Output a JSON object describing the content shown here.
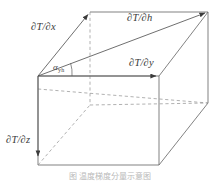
{
  "figure": {
    "labels": {
      "dtdx": "∂T/∂x",
      "dtdh": "∂T/∂h",
      "dtdy": "∂T/∂y",
      "dtdz": "∂T/∂z",
      "alpha": "α",
      "alpha_sub": "yh"
    },
    "caption": "图  温度梯度分量示意图",
    "colors": {
      "line": "#555555",
      "solid_edge": "#6b6b6b",
      "hidden_edge": "#8a8a8a",
      "vector": "#555555",
      "label_text": "#3a3a3a",
      "caption_text": "#b9b9b9",
      "background": "#ffffff"
    },
    "geometry": {
      "origin": [
        38,
        76
      ],
      "front_top_right": [
        159,
        76
      ],
      "front_bottom_left": [
        38,
        165
      ],
      "front_bottom_right": [
        159,
        165
      ],
      "back_top_left": [
        90,
        12
      ],
      "back_top_right": [
        208,
        12
      ],
      "back_bottom_right": [
        208,
        103
      ],
      "back_bottom_left": [
        90,
        105
      ]
    },
    "vectors": [
      {
        "name": "dtdx",
        "from": [
          38,
          76
        ],
        "to": [
          90,
          12
        ]
      },
      {
        "name": "dtdh",
        "from": [
          38,
          76
        ],
        "to": [
          208,
          12
        ]
      },
      {
        "name": "dtdy",
        "from": [
          38,
          76
        ],
        "to": [
          159,
          76
        ]
      },
      {
        "name": "dtdz",
        "from": [
          38,
          76
        ],
        "to": [
          38,
          159
        ]
      }
    ]
  }
}
